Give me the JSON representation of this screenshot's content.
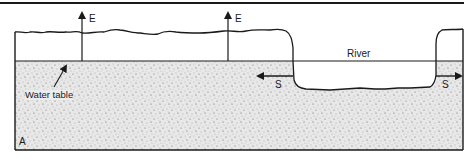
{
  "figure": {
    "panel_label": "A",
    "labels": {
      "evaporation_left": "E",
      "evaporation_right": "E",
      "river": "River",
      "water_table": "Water table",
      "seepage_left": "S",
      "seepage_right": "S"
    },
    "colors": {
      "line": "#1a1a1a",
      "soil_fill": "#e6e6e6",
      "background": "#ffffff"
    }
  }
}
